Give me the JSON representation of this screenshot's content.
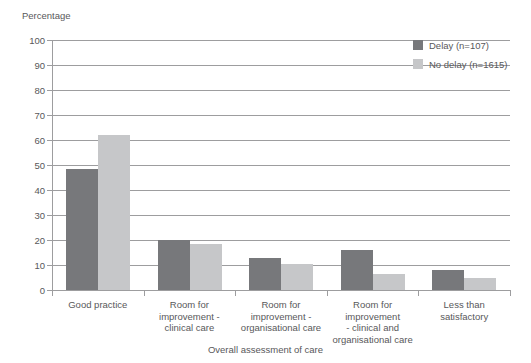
{
  "chart_data": {
    "type": "bar",
    "title": "",
    "ylabel": "Percentage",
    "xlabel": "Overall assessment of care",
    "ylim": [
      0,
      100
    ],
    "yticks": [
      0,
      10,
      20,
      30,
      40,
      50,
      60,
      70,
      80,
      90,
      100
    ],
    "grid": true,
    "legend_position": "top-right",
    "categories": [
      "Good practice",
      "Room for improvement - clinical care",
      "Room for improvement - organisational care",
      "Room for improvement - clinical and organisational care",
      "Less than satisfactory"
    ],
    "category_lines": [
      [
        "Good practice"
      ],
      [
        "Room for",
        "improvement -",
        "clinical care"
      ],
      [
        "Room for",
        "improvement -",
        "organisational care"
      ],
      [
        "Room for",
        "improvement",
        "- clinical and",
        "organisational care"
      ],
      [
        "Less than",
        "satisfactory"
      ]
    ],
    "series": [
      {
        "name": "Delay (n=107)",
        "color": "#77787b",
        "values": [
          48.5,
          20.0,
          13.0,
          16.0,
          8.0
        ]
      },
      {
        "name": "No delay (n=1615)",
        "color": "#c6c7c9",
        "values": [
          62.0,
          18.5,
          10.5,
          6.5,
          5.0
        ]
      }
    ]
  },
  "legend": {
    "items": [
      {
        "label": "Delay (n=107)",
        "color": "#77787b"
      },
      {
        "label": "No delay (n=1615)",
        "color": "#c6c7c9"
      }
    ]
  },
  "axes": {
    "y_title": "Percentage",
    "x_title": "Overall assessment of care",
    "y_tick_labels": [
      "0",
      "10",
      "20",
      "30",
      "40",
      "50",
      "60",
      "70",
      "80",
      "90",
      "100"
    ]
  },
  "colors": {
    "axis": "#9d9d9f",
    "text": "#58585a",
    "background": "#ffffff",
    "series_delay": "#77787b",
    "series_no_delay": "#c6c7c9"
  }
}
